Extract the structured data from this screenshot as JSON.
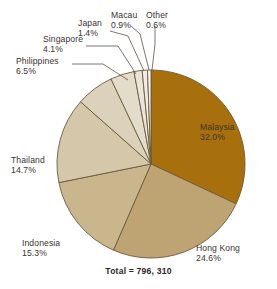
{
  "chart_data": {
    "type": "pie",
    "title": "",
    "subtitle": "",
    "xlabel": "",
    "ylabel": "",
    "legend_position": "callout-labels",
    "grid": false,
    "total_label": "Total = 796, 310",
    "total_value": "796, 310",
    "start_angle_deg": 0,
    "direction": "clockwise",
    "categories": [
      "Malaysia",
      "Hong Kong",
      "Indonesia",
      "Thailand",
      "Philippines",
      "Singapore",
      "Japan",
      "Macau",
      "Other"
    ],
    "values": [
      32.0,
      24.6,
      15.3,
      14.7,
      6.5,
      4.1,
      1.4,
      0.9,
      0.6
    ],
    "value_labels": [
      "32.0%",
      "24.6%",
      "15.3%",
      "14.7%",
      "6.5%",
      "4.1%",
      "1.4%",
      "0.9%",
      "0.6%"
    ],
    "colors": [
      "#a8700c",
      "#bea473",
      "#c9b68c",
      "#d4c7aa",
      "#dcd2bc",
      "#e3dccb",
      "#eae5d8",
      "#f0ede3",
      "#f6f4ee"
    ],
    "slices": [
      {
        "name": "Malaysia",
        "value": 32.0,
        "label": "Malaysia",
        "pct": "32.0%",
        "color": "#a8700c"
      },
      {
        "name": "Hong Kong",
        "value": 24.6,
        "label": "Hong Kong",
        "pct": "24.6%",
        "color": "#bea473"
      },
      {
        "name": "Indonesia",
        "value": 15.3,
        "label": "Indonesia",
        "pct": "15.3%",
        "color": "#c9b68c"
      },
      {
        "name": "Thailand",
        "value": 14.7,
        "label": "Thailand",
        "pct": "14.7%",
        "color": "#d4c7aa"
      },
      {
        "name": "Philippines",
        "value": 6.5,
        "label": "Philippines",
        "pct": "6.5%",
        "color": "#dcd2bc"
      },
      {
        "name": "Singapore",
        "value": 4.1,
        "label": "Singapore",
        "pct": "4.1%",
        "color": "#e3dccb"
      },
      {
        "name": "Japan",
        "value": 1.4,
        "label": "Japan",
        "pct": "1.4%",
        "color": "#eae5d8"
      },
      {
        "name": "Macau",
        "value": 0.9,
        "label": "Macau",
        "pct": "0.9%",
        "color": "#f0ede3"
      },
      {
        "name": "Other",
        "value": 0.6,
        "label": "Other",
        "pct": "0.6%",
        "color": "#f6f4ee"
      }
    ]
  },
  "geometry": {
    "center_x": 151,
    "center_y": 164,
    "radius": 94
  },
  "style": {
    "background": "#ffffff",
    "outline": "#6b5a3e",
    "text": "#3a3330",
    "leader": "#5d5249"
  }
}
